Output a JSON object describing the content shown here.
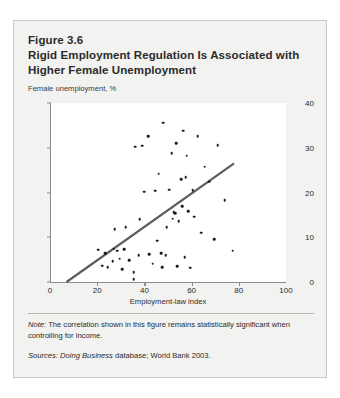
{
  "figure": {
    "number": "Figure 3.6",
    "title": "Rigid Employment Regulation Is Associated with Higher Female Unemployment",
    "note_label": "Note:",
    "note_text": "The correlation shown in this figure remains statistically significant when controlling for income.",
    "sources_label": "Sources:",
    "sources_italic": "Doing Business",
    "sources_text": "database; World Bank 2003."
  },
  "chart_data": {
    "type": "scatter",
    "title": "Rigid Employment Regulation Is Associated with Higher Female Unemployment",
    "subtitle": "Female unemployment, %",
    "xlabel": "Employment-law index",
    "ylabel": "Female unemployment, %",
    "xlim": [
      0,
      100
    ],
    "ylim": [
      0,
      40
    ],
    "xticks": [
      0,
      20,
      40,
      60,
      80,
      100
    ],
    "yticks": [
      0,
      10,
      20,
      30,
      40
    ],
    "grid": false,
    "legend": "none",
    "marker_color": "#1b1b1b",
    "trendline": {
      "color": "#5e5e5e",
      "width": 2.2,
      "x": [
        7,
        78
      ],
      "y": [
        0,
        26.5
      ]
    },
    "points": [
      {
        "x": 20.5,
        "y": 7.2
      },
      {
        "x": 22.0,
        "y": 3.6
      },
      {
        "x": 23.5,
        "y": 6.5
      },
      {
        "x": 24.5,
        "y": 3.3
      },
      {
        "x": 26.5,
        "y": 4.6
      },
      {
        "x": 27.0,
        "y": 7.4
      },
      {
        "x": 27.5,
        "y": 11.8
      },
      {
        "x": 28.5,
        "y": 7.0
      },
      {
        "x": 29.5,
        "y": 5.2
      },
      {
        "x": 30.5,
        "y": 2.8
      },
      {
        "x": 31.5,
        "y": 7.3
      },
      {
        "x": 32.0,
        "y": 12.2
      },
      {
        "x": 33.5,
        "y": 4.9
      },
      {
        "x": 35.5,
        "y": 0.6
      },
      {
        "x": 35.5,
        "y": 2.2
      },
      {
        "x": 36.0,
        "y": 30.2
      },
      {
        "x": 37.5,
        "y": 6.0
      },
      {
        "x": 38.0,
        "y": 14.0
      },
      {
        "x": 39.0,
        "y": 30.5
      },
      {
        "x": 40.0,
        "y": 20.2
      },
      {
        "x": 41.5,
        "y": 32.6
      },
      {
        "x": 42.0,
        "y": 6.2
      },
      {
        "x": 43.5,
        "y": 4.1
      },
      {
        "x": 44.5,
        "y": 20.4
      },
      {
        "x": 45.5,
        "y": 9.2
      },
      {
        "x": 46.0,
        "y": 24.2
      },
      {
        "x": 47.0,
        "y": 6.4
      },
      {
        "x": 47.5,
        "y": 3.3
      },
      {
        "x": 48.0,
        "y": 35.6
      },
      {
        "x": 49.0,
        "y": 6.0
      },
      {
        "x": 49.5,
        "y": 12.3
      },
      {
        "x": 50.5,
        "y": 20.6
      },
      {
        "x": 51.5,
        "y": 28.8
      },
      {
        "x": 52.0,
        "y": 14.1
      },
      {
        "x": 52.5,
        "y": 15.6
      },
      {
        "x": 53.0,
        "y": 15.4
      },
      {
        "x": 53.5,
        "y": 31.0
      },
      {
        "x": 54.0,
        "y": 3.5
      },
      {
        "x": 54.5,
        "y": 13.6
      },
      {
        "x": 55.5,
        "y": 23.0
      },
      {
        "x": 56.0,
        "y": 17.0
      },
      {
        "x": 56.5,
        "y": 33.8
      },
      {
        "x": 57.0,
        "y": 5.6
      },
      {
        "x": 57.5,
        "y": 23.4
      },
      {
        "x": 58.0,
        "y": 28.2
      },
      {
        "x": 58.5,
        "y": 15.8
      },
      {
        "x": 59.5,
        "y": 3.2
      },
      {
        "x": 60.5,
        "y": 20.5
      },
      {
        "x": 61.0,
        "y": 14.6
      },
      {
        "x": 62.5,
        "y": 32.6
      },
      {
        "x": 64.0,
        "y": 11.0
      },
      {
        "x": 65.5,
        "y": 25.8
      },
      {
        "x": 67.5,
        "y": 22.4
      },
      {
        "x": 69.5,
        "y": 9.6
      },
      {
        "x": 71.0,
        "y": 30.6
      },
      {
        "x": 74.0,
        "y": 18.3
      },
      {
        "x": 77.5,
        "y": 7.0
      }
    ]
  }
}
